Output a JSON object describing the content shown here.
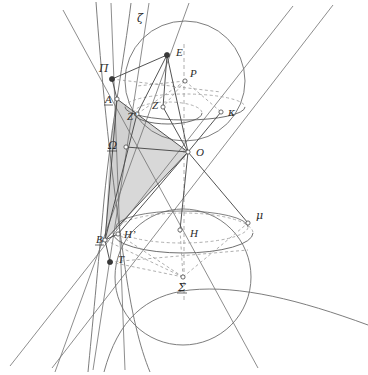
{
  "figure": {
    "background_color": "#ffffff",
    "stroke_color": "#707070",
    "stroke_color_dark": "#3c3c3c",
    "dash_color": "#9a9a9a",
    "shade_color": "#d6d6d6",
    "point_fill": "#3a3a3a",
    "point_open_fill": "#ffffff",
    "width": 368,
    "height": 375
  },
  "labels": [
    {
      "id": "zeta",
      "text": "ζ",
      "x": 137,
      "y": 22,
      "style": "greek",
      "underline": false
    },
    {
      "id": "E",
      "text": "E",
      "x": 176,
      "y": 56,
      "style": "latin",
      "underline": false
    },
    {
      "id": "Pi",
      "text": "Π",
      "x": 99,
      "y": 72,
      "style": "greek",
      "underline": false
    },
    {
      "id": "P",
      "text": "P",
      "x": 190,
      "y": 77,
      "style": "latin",
      "underline": false
    },
    {
      "id": "A",
      "text": "A",
      "x": 105,
      "y": 103,
      "style": "latin",
      "underline": true
    },
    {
      "id": "Z",
      "text": "Z",
      "x": 152,
      "y": 109,
      "style": "latin",
      "underline": false
    },
    {
      "id": "kappa",
      "text": "κ",
      "x": 228,
      "y": 116,
      "style": "greek",
      "underline": false
    },
    {
      "id": "Zprime",
      "text": "Z’",
      "x": 127,
      "y": 120,
      "style": "latin",
      "underline": false
    },
    {
      "id": "Omega",
      "text": "Ω",
      "x": 108,
      "y": 149,
      "style": "greek",
      "underline": true
    },
    {
      "id": "O",
      "text": "O",
      "x": 196,
      "y": 156,
      "style": "latin",
      "underline": false
    },
    {
      "id": "mu",
      "text": "μ",
      "x": 256,
      "y": 219,
      "style": "greek",
      "underline": false
    },
    {
      "id": "Hprime",
      "text": "H’",
      "x": 124,
      "y": 238,
      "style": "latin",
      "underline": false
    },
    {
      "id": "H",
      "text": "H",
      "x": 190,
      "y": 237,
      "style": "latin",
      "underline": false
    },
    {
      "id": "B",
      "text": "B",
      "x": 96,
      "y": 243,
      "style": "latin",
      "underline": true
    },
    {
      "id": "T",
      "text": "T",
      "x": 118,
      "y": 263,
      "style": "latin",
      "underline": false
    },
    {
      "id": "Sigma",
      "text": "Σ",
      "x": 184,
      "y": 291,
      "style": "greek",
      "underline": true
    }
  ],
  "points": [
    {
      "id": "pt-Pi",
      "x": 112,
      "y": 79,
      "kind": "filled"
    },
    {
      "id": "pt-E",
      "x": 167,
      "y": 55,
      "kind": "filled"
    },
    {
      "id": "pt-P",
      "x": 185,
      "y": 81,
      "kind": "open"
    },
    {
      "id": "pt-A",
      "x": 117,
      "y": 99,
      "kind": "open"
    },
    {
      "id": "pt-Z",
      "x": 163,
      "y": 107,
      "kind": "open"
    },
    {
      "id": "pt-Zprime",
      "x": 137,
      "y": 114,
      "kind": "open"
    },
    {
      "id": "pt-kappa",
      "x": 221,
      "y": 112,
      "kind": "open"
    },
    {
      "id": "pt-Omega",
      "x": 126,
      "y": 147,
      "kind": "open"
    },
    {
      "id": "pt-O",
      "x": 188,
      "y": 152,
      "kind": "open"
    },
    {
      "id": "pt-mu",
      "x": 248,
      "y": 223,
      "kind": "open"
    },
    {
      "id": "pt-Hprime",
      "x": 118,
      "y": 234,
      "kind": "open"
    },
    {
      "id": "pt-H",
      "x": 180,
      "y": 230,
      "kind": "open"
    },
    {
      "id": "pt-B",
      "x": 105,
      "y": 240,
      "kind": "open"
    },
    {
      "id": "pt-T",
      "x": 110,
      "y": 262,
      "kind": "filled"
    },
    {
      "id": "pt-Sigma",
      "x": 183,
      "y": 277,
      "kind": "open"
    }
  ],
  "spheres": [
    {
      "id": "upper-sphere",
      "cx": 185,
      "cy": 81,
      "r": 60,
      "equator_ry": 18,
      "equator_cy": 103,
      "tangent_ry": 13,
      "tangent_cy": 107
    },
    {
      "id": "lower-sphere",
      "cx": 183,
      "cy": 277,
      "r": 68,
      "equator_ry": 22,
      "equator_cy": 238,
      "tangent_ry": 17,
      "tangent_cy": 230
    }
  ],
  "cone": {
    "apex": {
      "x": 110,
      "y": 262
    },
    "generators": 6
  },
  "shaded_region": {
    "id": "section-plane-shade",
    "fill": "#d6d6d6",
    "vertices": "117,99 137,114 188,152 105,240 112,117"
  }
}
